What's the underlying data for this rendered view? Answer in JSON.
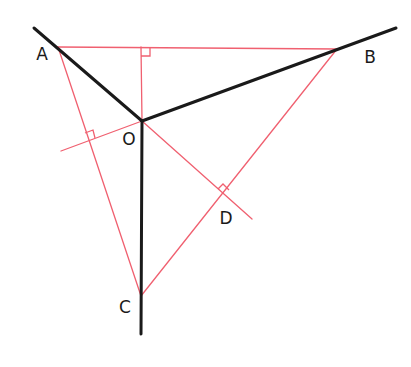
{
  "diagram": {
    "type": "geometry-construction",
    "colors": {
      "black_lines": "#1a1a1a",
      "red_lines": "#f06070",
      "label_text": "#1a1a1a",
      "background": "#ffffff"
    },
    "points": {
      "A": {
        "label": "A",
        "x": 58,
        "y": 47
      },
      "B": {
        "label": "B",
        "x": 337,
        "y": 49
      },
      "C": {
        "label": "C",
        "x": 141,
        "y": 296
      },
      "O": {
        "label": "O",
        "x": 142,
        "y": 121
      },
      "D": {
        "label": "D",
        "x": 224,
        "y": 194
      }
    },
    "labels": [
      {
        "id": "A",
        "text": "A",
        "x": 42,
        "y": 54
      },
      {
        "id": "B",
        "text": "B",
        "x": 370,
        "y": 57
      },
      {
        "id": "O",
        "text": "O",
        "x": 129,
        "y": 139
      },
      {
        "id": "D",
        "text": "D",
        "x": 226,
        "y": 218
      },
      {
        "id": "C",
        "text": "C",
        "x": 125,
        "y": 307
      }
    ],
    "black_rays": [
      {
        "name": "ray-OA",
        "from": [
          142,
          121
        ],
        "to": [
          34,
          28
        ]
      },
      {
        "name": "ray-OB",
        "from": [
          142,
          121
        ],
        "to": [
          396,
          28
        ]
      },
      {
        "name": "ray-OC",
        "from": [
          142,
          121
        ],
        "to": [
          141,
          334
        ]
      }
    ],
    "red_segments": [
      {
        "name": "segment-AB",
        "from": [
          58,
          47
        ],
        "to": [
          337,
          49
        ]
      },
      {
        "name": "segment-AC",
        "from": [
          58,
          47
        ],
        "to": [
          141,
          296
        ]
      },
      {
        "name": "segment-BC",
        "from": [
          337,
          49
        ],
        "to": [
          141,
          296
        ]
      },
      {
        "name": "perpendicular-O-to-AB",
        "from": [
          142,
          121
        ],
        "to": [
          141,
          47
        ]
      },
      {
        "name": "perpendicular-O-to-AC",
        "from": [
          142,
          121
        ],
        "to": [
          61,
          151
        ]
      },
      {
        "name": "perpendicular-O-to-BC",
        "from": [
          142,
          121
        ],
        "to": [
          252,
          219
        ]
      }
    ],
    "right_angle_marks": [
      {
        "name": "right-angle-AB",
        "points": [
          [
            141,
            56
          ],
          [
            150,
            56
          ],
          [
            150,
            48
          ]
        ]
      },
      {
        "name": "right-angle-AC",
        "points": [
          [
            85,
            133
          ],
          [
            93,
            130
          ],
          [
            95,
            138
          ]
        ]
      },
      {
        "name": "right-angle-BC",
        "points": [
          [
            218,
            189
          ],
          [
            223,
            184
          ],
          [
            229,
            190
          ]
        ]
      }
    ]
  }
}
